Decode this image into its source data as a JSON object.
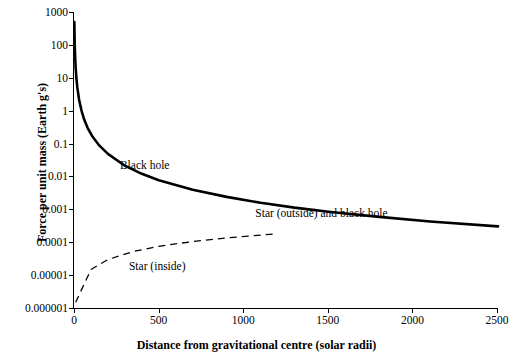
{
  "chart_data": {
    "type": "line",
    "title": "",
    "xlabel": "Distance from gravitational centre (solar radii)",
    "ylabel": "Force per unit mass (Earth g's)",
    "xlim": [
      0,
      2500
    ],
    "ylim": [
      1e-06,
      1000
    ],
    "yscale": "log",
    "grid": false,
    "legend": "none (inline annotations)",
    "xticks": [
      "0",
      "500",
      "1000",
      "1500",
      "2000",
      "2500"
    ],
    "yticks": [
      "1000",
      "100",
      "10",
      "1",
      "0.1",
      "0.01",
      "0.001",
      "0.0001",
      "0.00001",
      "0.000001"
    ],
    "annotations": [
      {
        "text": "Black hole",
        "x": 330,
        "y": 0.02
      },
      {
        "text": "Star (outside) and black hole",
        "x": 1600,
        "y": 0.0006
      },
      {
        "text": "Star (inside)",
        "x": 560,
        "y": 1.8e-05
      }
    ],
    "series": [
      {
        "name": "Star (outside) and black hole",
        "style": "solid",
        "color": "#000000",
        "points": [
          {
            "x": 2,
            "y": 500
          },
          {
            "x": 3,
            "y": 220
          },
          {
            "x": 4,
            "y": 125
          },
          {
            "x": 6,
            "y": 55
          },
          {
            "x": 8,
            "y": 31
          },
          {
            "x": 10,
            "y": 20
          },
          {
            "x": 14,
            "y": 10
          },
          {
            "x": 20,
            "y": 5
          },
          {
            "x": 30,
            "y": 2.2
          },
          {
            "x": 45,
            "y": 1.0
          },
          {
            "x": 60,
            "y": 0.55
          },
          {
            "x": 80,
            "y": 0.31
          },
          {
            "x": 110,
            "y": 0.165
          },
          {
            "x": 150,
            "y": 0.089
          },
          {
            "x": 200,
            "y": 0.05
          },
          {
            "x": 300,
            "y": 0.022
          },
          {
            "x": 400,
            "y": 0.0125
          },
          {
            "x": 500,
            "y": 0.008
          },
          {
            "x": 700,
            "y": 0.0041
          },
          {
            "x": 900,
            "y": 0.0025
          },
          {
            "x": 1100,
            "y": 0.00165
          },
          {
            "x": 1300,
            "y": 0.00118
          },
          {
            "x": 1500,
            "y": 0.00089
          },
          {
            "x": 1800,
            "y": 0.00062
          },
          {
            "x": 2100,
            "y": 0.00045
          },
          {
            "x": 2500,
            "y": 0.00032
          }
        ]
      },
      {
        "name": "Star (inside)",
        "style": "dashed",
        "color": "#000000",
        "points": [
          {
            "x": 10,
            "y": 1.6e-06
          },
          {
            "x": 100,
            "y": 1.58e-05
          },
          {
            "x": 200,
            "y": 3.16e-05
          },
          {
            "x": 350,
            "y": 5.55e-05
          },
          {
            "x": 500,
            "y": 7.93e-05
          },
          {
            "x": 700,
            "y": 0.000111
          },
          {
            "x": 900,
            "y": 0.000143
          },
          {
            "x": 1050,
            "y": 0.000166
          },
          {
            "x": 1180,
            "y": 0.000187
          }
        ]
      }
    ]
  }
}
